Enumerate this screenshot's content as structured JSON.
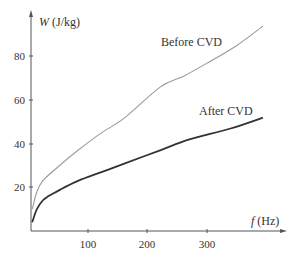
{
  "chart_data": {
    "type": "line",
    "title": "",
    "xlabel": "f (Hz)",
    "ylabel": "W (J/kg)",
    "xlabel_var": "f",
    "xlabel_unit": "(Hz)",
    "ylabel_var": "W",
    "ylabel_unit": "(J/kg)",
    "xlim": [
      0,
      400
    ],
    "ylim": [
      0,
      100
    ],
    "xticks": [
      100,
      200,
      300
    ],
    "yticks": [
      20,
      40,
      60,
      80
    ],
    "grid": false,
    "legend": "inline annotations",
    "series": [
      {
        "name": "Before CVD",
        "color": "#9a9a9a",
        "x": [
          2,
          10,
          20,
          40,
          80,
          120,
          160,
          220,
          260,
          300,
          350,
          395
        ],
        "y": [
          10,
          18,
          23,
          28,
          37,
          45,
          52,
          66,
          71,
          77,
          85,
          94
        ]
      },
      {
        "name": "After CVD",
        "color": "#333333",
        "x": [
          2,
          10,
          20,
          30,
          50,
          80,
          120,
          160,
          220,
          270,
          340,
          395
        ],
        "y": [
          4,
          10,
          14,
          16,
          19,
          23,
          27,
          31,
          37,
          42,
          47,
          52
        ]
      }
    ],
    "annotations": [
      {
        "text": "Before CVD",
        "x": 265,
        "y": 85
      },
      {
        "text": "After CVD",
        "x": 265,
        "y": 57
      }
    ]
  },
  "labels": {
    "ytick_80": "80",
    "ytick_60": "60",
    "ytick_40": "40",
    "ytick_20": "20",
    "xtick_100": "100",
    "xtick_200": "200",
    "xtick_300": "300",
    "before": "Before CVD",
    "after": "After CVD"
  }
}
